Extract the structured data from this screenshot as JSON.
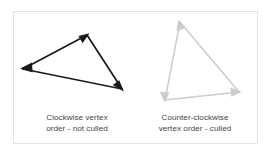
{
  "figure": {
    "panel": {
      "background_color": "#ffffff",
      "border_color": "#e3e3e3"
    }
  },
  "captions": {
    "clockwise": {
      "line1": "Clockwise vertex",
      "line2": "order - not culled",
      "color": "#444444"
    },
    "counter_clockwise": {
      "line1": "Counter-clockwise",
      "line2": "vertex order - culled",
      "color": "#444444"
    }
  },
  "shapes": {
    "clockwise_triangle": {
      "name": "clockwise-triangle",
      "stroke_color": "#1a1a1a",
      "arrowhead_color": "#1a1a1a",
      "winding": "clockwise",
      "culled": false,
      "vertices": [
        {
          "label": "left",
          "x": 23,
          "y": 69
        },
        {
          "label": "top",
          "x": 87,
          "y": 35
        },
        {
          "label": "bottom-right",
          "x": 122,
          "y": 89
        }
      ]
    },
    "counter_clockwise_triangle": {
      "name": "counter-clockwise-triangle",
      "stroke_color": "#cccccc",
      "arrowhead_color": "#cccccc",
      "winding": "counter-clockwise",
      "culled": true,
      "vertices": [
        {
          "label": "top",
          "x": 180,
          "y": 22
        },
        {
          "label": "bottom-left",
          "x": 165,
          "y": 100
        },
        {
          "label": "right",
          "x": 239,
          "y": 92
        }
      ]
    }
  }
}
